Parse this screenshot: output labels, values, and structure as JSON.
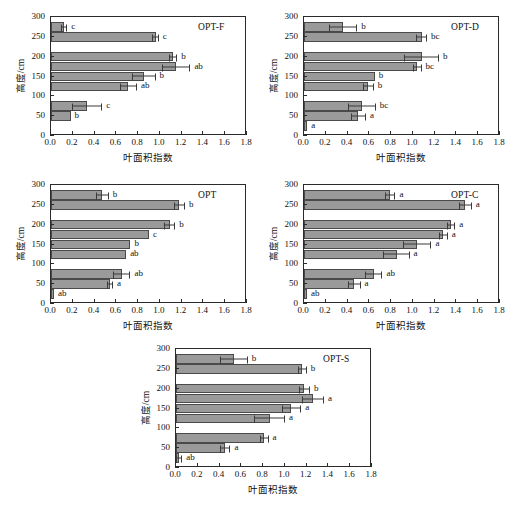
{
  "figure": {
    "xlabel": "叶面积指数",
    "ylabel": "高度/cm",
    "xticks": [
      "0.0",
      "0.2",
      "0.4",
      "0.6",
      "0.8",
      "1.0",
      "1.2",
      "1.4",
      "1.6",
      "1.8"
    ],
    "yticks": [
      "0",
      "50",
      "100",
      "150",
      "200",
      "250",
      "300"
    ],
    "bar_color": "#9a9a9a",
    "bar_edge_color": "#4a4a4a",
    "axis_color": "#2a2a2a"
  },
  "chart_data": [
    {
      "type": "bar",
      "orientation": "horizontal",
      "title": "OPT-F",
      "xlabel": "叶面积指数",
      "ylabel": "高度/cm",
      "xlim": [
        0.0,
        1.8
      ],
      "ylim": [
        0,
        300
      ],
      "grid": false,
      "categories": [
        25,
        75,
        125,
        175,
        225,
        275
      ],
      "heights_cm": [
        275,
        250,
        200,
        175,
        150,
        125,
        75,
        50
      ],
      "values": [
        0.12,
        0.96,
        1.12,
        1.15,
        0.85,
        0.71,
        0.33,
        0.18
      ],
      "errors": [
        0.03,
        0.03,
        0.04,
        0.13,
        0.11,
        0.08,
        0.14,
        0.0
      ],
      "annotations": [
        "c",
        "c",
        "b",
        "ab",
        "b",
        "ab",
        "c",
        "b"
      ]
    },
    {
      "type": "bar",
      "orientation": "horizontal",
      "title": "OPT-D",
      "xlabel": "叶面积指数",
      "ylabel": "高度/cm",
      "xlim": [
        0.0,
        1.8
      ],
      "ylim": [
        0,
        300
      ],
      "grid": false,
      "heights_cm": [
        275,
        250,
        200,
        175,
        150,
        125,
        75,
        50,
        25
      ],
      "values": [
        0.36,
        1.08,
        1.08,
        1.04,
        0.65,
        0.59,
        0.53,
        0.5,
        0.03
      ],
      "errors": [
        0.13,
        0.05,
        0.16,
        0.04,
        0.0,
        0.05,
        0.13,
        0.07,
        0.0
      ],
      "annotations": [
        "b",
        "bc",
        "b",
        "bc",
        "b",
        "b",
        "bc",
        "a",
        "a"
      ]
    },
    {
      "type": "bar",
      "orientation": "horizontal",
      "title": "OPT",
      "xlabel": "叶面积指数",
      "ylabel": "高度/cm",
      "xlim": [
        0.0,
        1.8
      ],
      "ylim": [
        0,
        300
      ],
      "grid": false,
      "heights_cm": [
        275,
        250,
        200,
        175,
        150,
        125,
        75,
        50,
        25
      ],
      "values": [
        0.47,
        1.18,
        1.09,
        0.9,
        0.73,
        0.69,
        0.65,
        0.54,
        0.02
      ],
      "errors": [
        0.06,
        0.05,
        0.05,
        0.0,
        0.0,
        0.0,
        0.08,
        0.03,
        0.0
      ],
      "annotations": [
        "b",
        "b",
        "b",
        "c",
        "b",
        "ab",
        "ab",
        "a",
        "ab"
      ]
    },
    {
      "type": "bar",
      "orientation": "horizontal",
      "title": "OPT-C",
      "xlabel": "叶面积指数",
      "ylabel": "高度/cm",
      "xlim": [
        0.0,
        1.8
      ],
      "ylim": [
        0,
        300
      ],
      "grid": false,
      "heights_cm": [
        275,
        250,
        200,
        175,
        150,
        125,
        75,
        50,
        25
      ],
      "values": [
        0.79,
        1.48,
        1.35,
        1.28,
        1.04,
        0.85,
        0.64,
        0.46,
        0.02
      ],
      "errors": [
        0.05,
        0.06,
        0.04,
        0.04,
        0.13,
        0.12,
        0.08,
        0.06,
        0.0
      ],
      "annotations": [
        "a",
        "a",
        "a",
        "a",
        "a",
        "a",
        "ab",
        "a",
        "ab"
      ]
    },
    {
      "type": "bar",
      "orientation": "horizontal",
      "title": "OPT-S",
      "xlabel": "叶面积指数",
      "ylabel": "高度/cm",
      "xlim": [
        0.0,
        1.8
      ],
      "ylim": [
        0,
        300
      ],
      "grid": false,
      "heights_cm": [
        275,
        250,
        200,
        175,
        150,
        125,
        75,
        50,
        25
      ],
      "values": [
        0.53,
        1.16,
        1.18,
        1.26,
        1.06,
        0.86,
        0.81,
        0.45,
        0.02
      ],
      "errors": [
        0.13,
        0.04,
        0.05,
        0.1,
        0.09,
        0.14,
        0.04,
        0.05,
        0.03
      ],
      "annotations": [
        "b",
        "b",
        "b",
        "a",
        "a",
        "a",
        "a",
        "a",
        "ab"
      ]
    }
  ]
}
